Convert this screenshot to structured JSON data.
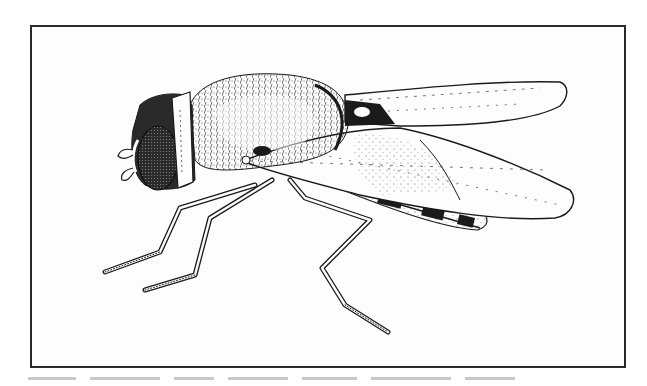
{
  "figure": {
    "style": "pen-and-ink stipple drawing",
    "view": "lateral view, head facing left",
    "parts": [
      "head",
      "compound-eye",
      "antennae",
      "thorax",
      "wings",
      "abdomen",
      "legs"
    ],
    "colors": {
      "ink": "#1a1a1a",
      "frame": "#2a2a2a",
      "paper": "#fdfdfd"
    }
  },
  "caption": {
    "visible": false,
    "note": "caption text truncated at bottom edge"
  }
}
